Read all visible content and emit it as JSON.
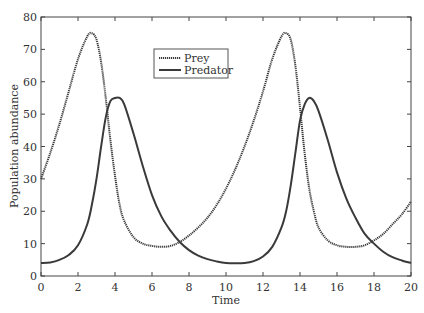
{
  "chart_data": {
    "type": "line",
    "title": "",
    "xlabel": "Time",
    "ylabel": "Population abundance",
    "xlim": [
      0,
      20
    ],
    "ylim": [
      0,
      80
    ],
    "xticks": [
      0,
      2,
      4,
      6,
      8,
      10,
      12,
      14,
      16,
      18,
      20
    ],
    "yticks": [
      0,
      10,
      20,
      30,
      40,
      50,
      60,
      70,
      80
    ],
    "grid": false,
    "legend_position": "upper center-left",
    "x": [
      0,
      0.5,
      1,
      1.5,
      2,
      2.5,
      2.75,
      3,
      3.25,
      3.5,
      3.75,
      4,
      4.25,
      4.5,
      5,
      5.5,
      6,
      6.5,
      7,
      7.5,
      8,
      8.5,
      9,
      9.5,
      10,
      10.5,
      11,
      11.5,
      12,
      12.5,
      13,
      13.25,
      13.5,
      13.75,
      14,
      14.25,
      14.5,
      14.75,
      15,
      15.5,
      16,
      16.5,
      17,
      17.5,
      18,
      18.5,
      19,
      19.5,
      20
    ],
    "series": [
      {
        "name": "Prey",
        "style": "dotted",
        "values": [
          30,
          38,
          47,
          57,
          67,
          74,
          75,
          73,
          66,
          55,
          42,
          31,
          22,
          17,
          12,
          10,
          9.3,
          9,
          9.3,
          10.5,
          12.5,
          15,
          18,
          22,
          27,
          33,
          40,
          48,
          57,
          67,
          74,
          75,
          73,
          65,
          52,
          38,
          27,
          20,
          15,
          11,
          9.5,
          9,
          9,
          9.5,
          11,
          13,
          16,
          19,
          23
        ]
      },
      {
        "name": "Predator",
        "style": "solid",
        "values": [
          4,
          4.2,
          5,
          6.5,
          9.5,
          16,
          22,
          30,
          40,
          49,
          54,
          55,
          55,
          53,
          44,
          34,
          25,
          18.5,
          14,
          10.5,
          8,
          6.3,
          5.2,
          4.5,
          4,
          3.9,
          4,
          4.6,
          6,
          9,
          15,
          20,
          28,
          38,
          48,
          53,
          55,
          54,
          51,
          42,
          32,
          24,
          18,
          13,
          10,
          7.5,
          5.8,
          4.8,
          4
        ]
      }
    ]
  },
  "legend": {
    "items": [
      {
        "label": "Prey"
      },
      {
        "label": "Predator"
      }
    ]
  },
  "colors": {
    "line": "#3a3a3a",
    "axis": "#333333"
  }
}
